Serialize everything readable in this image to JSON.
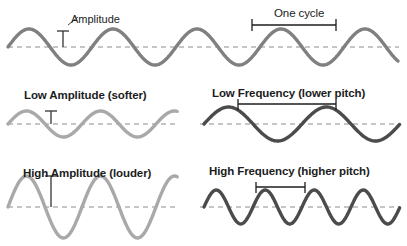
{
  "figure": {
    "title_visible": false,
    "background": "#ffffff",
    "colors": {
      "wave_medium_gray": "#808080",
      "wave_light_gray": "#a9a9a9",
      "wave_dark_gray": "#4b4b4b",
      "baseline_dash": "#8c8c8c",
      "text": "#1c1c1c",
      "marker": "#333333"
    }
  },
  "labels": {
    "amplitude": "Amplitude",
    "one_cycle": "One cycle",
    "low_amplitude": "Low Amplitude (softer)",
    "low_frequency": "Low Frequency (lower pitch)",
    "high_amplitude": "High Amplitude (louder)",
    "high_frequency": "High Frequency (higher pitch)"
  },
  "chart_data": {
    "type": "line",
    "title": "",
    "xlabel": "",
    "ylabel": "",
    "grid": false,
    "legend": "none",
    "annotations": [
      "Amplitude",
      "One cycle",
      "Low Amplitude (softer)",
      "Low Frequency (lower pitch)",
      "High Amplitude (louder)",
      "High Frequency (higher pitch)"
    ],
    "series": [
      {
        "name": "reference-wave",
        "panel": "top",
        "color": "#808080",
        "baseline_y": 47,
        "amplitude_px": 18,
        "wavelength_px": 84,
        "cycles_visible": 4.6,
        "x_start": 8,
        "x_end": 399,
        "stroke_width": 3.4,
        "annotation_amplitude_x": 63,
        "annotation_cycle_start_x": 252,
        "annotation_cycle_end_x": 336
      },
      {
        "name": "low-amplitude-wave",
        "panel": "mid-left",
        "color": "#a9a9a9",
        "baseline_y": 124,
        "amplitude_px": 13,
        "wavelength_px": 74,
        "cycles_visible": 2.35,
        "x_start": 8,
        "x_end": 178,
        "stroke_width": 3.4,
        "annotation_amplitude_x": 51
      },
      {
        "name": "low-frequency-wave",
        "panel": "mid-right",
        "color": "#4b4b4b",
        "baseline_y": 124,
        "amplitude_px": 17,
        "wavelength_px": 98,
        "cycles_visible": 2.0,
        "x_start": 204,
        "x_end": 400,
        "stroke_width": 3.4,
        "annotation_cycle_start_x": 238,
        "annotation_cycle_end_x": 336
      },
      {
        "name": "high-amplitude-wave",
        "panel": "bottom-left",
        "color": "#a9a9a9",
        "baseline_y": 207,
        "amplitude_px": 31,
        "wavelength_px": 74,
        "cycles_visible": 2.35,
        "x_start": 8,
        "x_end": 178,
        "stroke_width": 3.4,
        "annotation_amplitude_x": 51
      },
      {
        "name": "high-frequency-wave",
        "panel": "bottom-right",
        "color": "#4b4b4b",
        "baseline_y": 207,
        "amplitude_px": 17,
        "wavelength_px": 49,
        "cycles_visible": 4.1,
        "x_start": 204,
        "x_end": 400,
        "stroke_width": 3.4,
        "annotation_cycle_start_x": 256,
        "annotation_cycle_end_x": 305
      }
    ],
    "baselines": [
      {
        "name": "top-baseline",
        "y": 47,
        "x_start": 8,
        "x_end": 399
      },
      {
        "name": "mid-left-baseline",
        "y": 124,
        "x_start": 8,
        "x_end": 178
      },
      {
        "name": "mid-right-baseline",
        "y": 124,
        "x_start": 200,
        "x_end": 400
      },
      {
        "name": "bottom-left-baseline",
        "y": 207,
        "x_start": 8,
        "x_end": 178
      },
      {
        "name": "bottom-right-baseline",
        "y": 207,
        "x_start": 200,
        "x_end": 400
      }
    ]
  }
}
